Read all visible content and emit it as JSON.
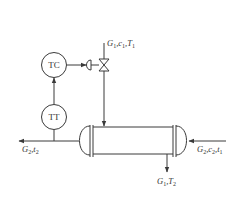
{
  "diagram": {
    "type": "process-control-heat-exchanger",
    "instruments": {
      "controller": "TC",
      "transmitter": "TT"
    },
    "streams": {
      "top_inlet": {
        "base": [
          "G",
          "c",
          "T"
        ],
        "subs": [
          "1",
          "1",
          "1"
        ]
      },
      "left_outlet": {
        "base": [
          "G",
          "t"
        ],
        "subs": [
          "2",
          "2"
        ]
      },
      "right_inlet": {
        "base": [
          "G",
          "c",
          "t"
        ],
        "subs": [
          "2",
          "2",
          "1"
        ]
      },
      "bottom_outlet": {
        "base": [
          "G",
          "T"
        ],
        "subs": [
          "1",
          "2"
        ]
      }
    },
    "labels": {
      "top_inlet": "G1,c1,T1",
      "left_outlet": "G2,t2",
      "right_inlet": "G2,c2,t1",
      "bottom_outlet": "G1,T2"
    },
    "line_color": "#3a3a3a"
  }
}
